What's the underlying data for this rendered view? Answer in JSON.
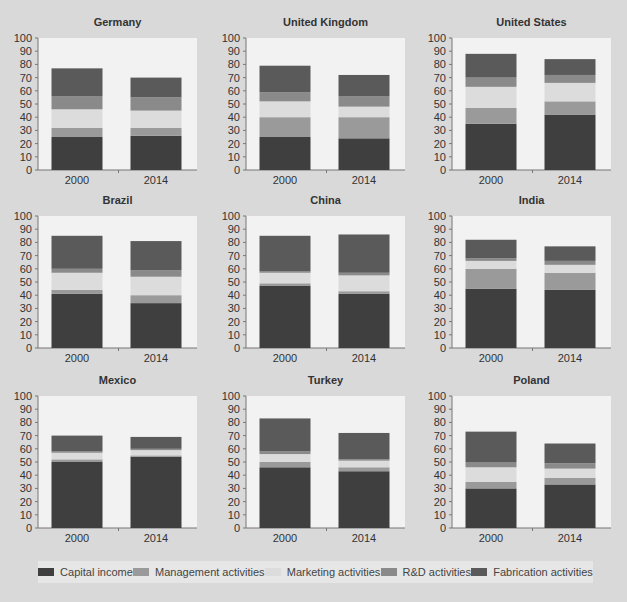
{
  "chart_data": {
    "type": "bar",
    "stacked": true,
    "categories": [
      "2000",
      "2014"
    ],
    "ylim": [
      0,
      100
    ],
    "yticks": [
      0,
      10,
      20,
      30,
      40,
      50,
      60,
      70,
      80,
      90,
      100
    ],
    "legend_position": "bottom",
    "grid": false,
    "series_names": [
      "Capital income",
      "Management activities",
      "Marketing activities",
      "R&D activities",
      "Fabrication activities"
    ],
    "colors": {
      "Capital income": "#3f3f3f",
      "Management activities": "#9a9a9a",
      "Marketing activities": "#dcdcdc",
      "R&D activities": "#8a8a8a",
      "Fabrication activities": "#5a5a5a"
    },
    "panels": [
      {
        "title": "Germany",
        "series": [
          {
            "name": "Capital income",
            "values": [
              25,
              26
            ]
          },
          {
            "name": "Management activities",
            "values": [
              7,
              6
            ]
          },
          {
            "name": "Marketing activities",
            "values": [
              14,
              13
            ]
          },
          {
            "name": "R&D activities",
            "values": [
              10,
              10
            ]
          },
          {
            "name": "Fabrication activities",
            "values": [
              21,
              15
            ]
          }
        ]
      },
      {
        "title": "United Kingdom",
        "series": [
          {
            "name": "Capital income",
            "values": [
              25,
              24
            ]
          },
          {
            "name": "Management activities",
            "values": [
              15,
              16
            ]
          },
          {
            "name": "Marketing activities",
            "values": [
              12,
              8
            ]
          },
          {
            "name": "R&D activities",
            "values": [
              7,
              8
            ]
          },
          {
            "name": "Fabrication activities",
            "values": [
              20,
              16
            ]
          }
        ]
      },
      {
        "title": "United States",
        "series": [
          {
            "name": "Capital income",
            "values": [
              35,
              42
            ]
          },
          {
            "name": "Management activities",
            "values": [
              12,
              10
            ]
          },
          {
            "name": "Marketing activities",
            "values": [
              16,
              14
            ]
          },
          {
            "name": "R&D activities",
            "values": [
              7,
              6
            ]
          },
          {
            "name": "Fabrication activities",
            "values": [
              18,
              12
            ]
          }
        ]
      },
      {
        "title": "Brazil",
        "series": [
          {
            "name": "Capital income",
            "values": [
              41,
              34
            ]
          },
          {
            "name": "Management activities",
            "values": [
              3,
              6
            ]
          },
          {
            "name": "Marketing activities",
            "values": [
              13,
              14
            ]
          },
          {
            "name": "R&D activities",
            "values": [
              3,
              5
            ]
          },
          {
            "name": "Fabrication activities",
            "values": [
              25,
              22
            ]
          }
        ]
      },
      {
        "title": "China",
        "series": [
          {
            "name": "Capital income",
            "values": [
              47,
              41
            ]
          },
          {
            "name": "Management activities",
            "values": [
              2,
              2
            ]
          },
          {
            "name": "Marketing activities",
            "values": [
              8,
              12
            ]
          },
          {
            "name": "R&D activities",
            "values": [
              1,
              2
            ]
          },
          {
            "name": "Fabrication activities",
            "values": [
              27,
              29
            ]
          }
        ]
      },
      {
        "title": "India",
        "series": [
          {
            "name": "Capital income",
            "values": [
              45,
              44
            ]
          },
          {
            "name": "Management activities",
            "values": [
              15,
              13
            ]
          },
          {
            "name": "Marketing activities",
            "values": [
              6,
              6
            ]
          },
          {
            "name": "R&D activities",
            "values": [
              2,
              3
            ]
          },
          {
            "name": "Fabrication activities",
            "values": [
              14,
              11
            ]
          }
        ]
      },
      {
        "title": "Mexico",
        "series": [
          {
            "name": "Capital income",
            "values": [
              50,
              54
            ]
          },
          {
            "name": "Management activities",
            "values": [
              2,
              1
            ]
          },
          {
            "name": "Marketing activities",
            "values": [
              5,
              4
            ]
          },
          {
            "name": "R&D activities",
            "values": [
              1,
              1
            ]
          },
          {
            "name": "Fabrication activities",
            "values": [
              12,
              9
            ]
          }
        ]
      },
      {
        "title": "Turkey",
        "series": [
          {
            "name": "Capital income",
            "values": [
              46,
              43
            ]
          },
          {
            "name": "Management activities",
            "values": [
              4,
              3
            ]
          },
          {
            "name": "Marketing activities",
            "values": [
              6,
              5
            ]
          },
          {
            "name": "R&D activities",
            "values": [
              2,
              1
            ]
          },
          {
            "name": "Fabrication activities",
            "values": [
              25,
              20
            ]
          }
        ]
      },
      {
        "title": "Poland",
        "series": [
          {
            "name": "Capital income",
            "values": [
              30,
              33
            ]
          },
          {
            "name": "Management activities",
            "values": [
              5,
              5
            ]
          },
          {
            "name": "Marketing activities",
            "values": [
              11,
              7
            ]
          },
          {
            "name": "R&D activities",
            "values": [
              4,
              4
            ]
          },
          {
            "name": "Fabrication activities",
            "values": [
              23,
              15
            ]
          }
        ]
      }
    ]
  }
}
